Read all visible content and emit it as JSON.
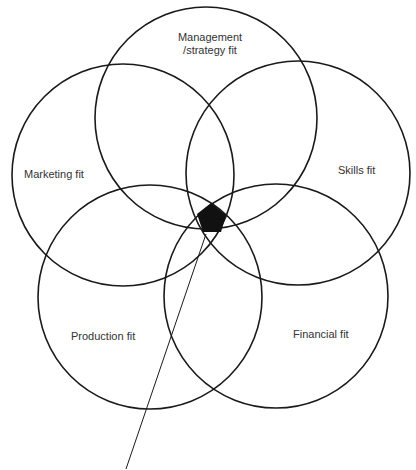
{
  "diagram": {
    "type": "five-circle venn",
    "circles": [
      {
        "id": "management",
        "label_line1": "Management",
        "label_line2": "/strategy fit",
        "cx": 206,
        "cy": 118,
        "r": 111
      },
      {
        "id": "marketing",
        "label": "Marketing fit",
        "cx": 123,
        "cy": 175,
        "r": 111
      },
      {
        "id": "skills",
        "label": "Skills fit",
        "cx": 298,
        "cy": 173,
        "r": 112
      },
      {
        "id": "production",
        "label": "Production fit",
        "cx": 150,
        "cy": 297,
        "r": 112
      },
      {
        "id": "financial",
        "label": "Financial fit",
        "cx": 276,
        "cy": 296,
        "r": 112
      }
    ],
    "center_region": "filled black pentagon (intersection of all five)",
    "stroke_color": "#1a1a1a",
    "fill_color": "#111111"
  }
}
